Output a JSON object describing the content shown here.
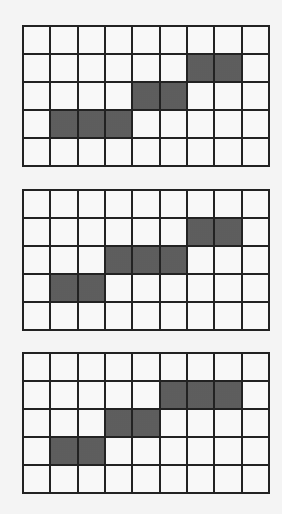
{
  "figure": {
    "columns": 9,
    "rows": 5,
    "colors": {
      "filled": "#6e6e6e",
      "empty": "#f8f8f8",
      "gridline": "#222222"
    },
    "grids": [
      {
        "id": "grid-1",
        "filled_cells": [
          [
            1,
            6
          ],
          [
            1,
            7
          ],
          [
            2,
            4
          ],
          [
            2,
            5
          ],
          [
            3,
            1
          ],
          [
            3,
            2
          ],
          [
            3,
            3
          ]
        ]
      },
      {
        "id": "grid-2",
        "filled_cells": [
          [
            1,
            6
          ],
          [
            1,
            7
          ],
          [
            2,
            3
          ],
          [
            2,
            4
          ],
          [
            2,
            5
          ],
          [
            3,
            1
          ],
          [
            3,
            2
          ]
        ]
      },
      {
        "id": "grid-3",
        "filled_cells": [
          [
            1,
            5
          ],
          [
            1,
            6
          ],
          [
            1,
            7
          ],
          [
            2,
            3
          ],
          [
            2,
            4
          ],
          [
            3,
            1
          ],
          [
            3,
            2
          ]
        ]
      }
    ]
  }
}
